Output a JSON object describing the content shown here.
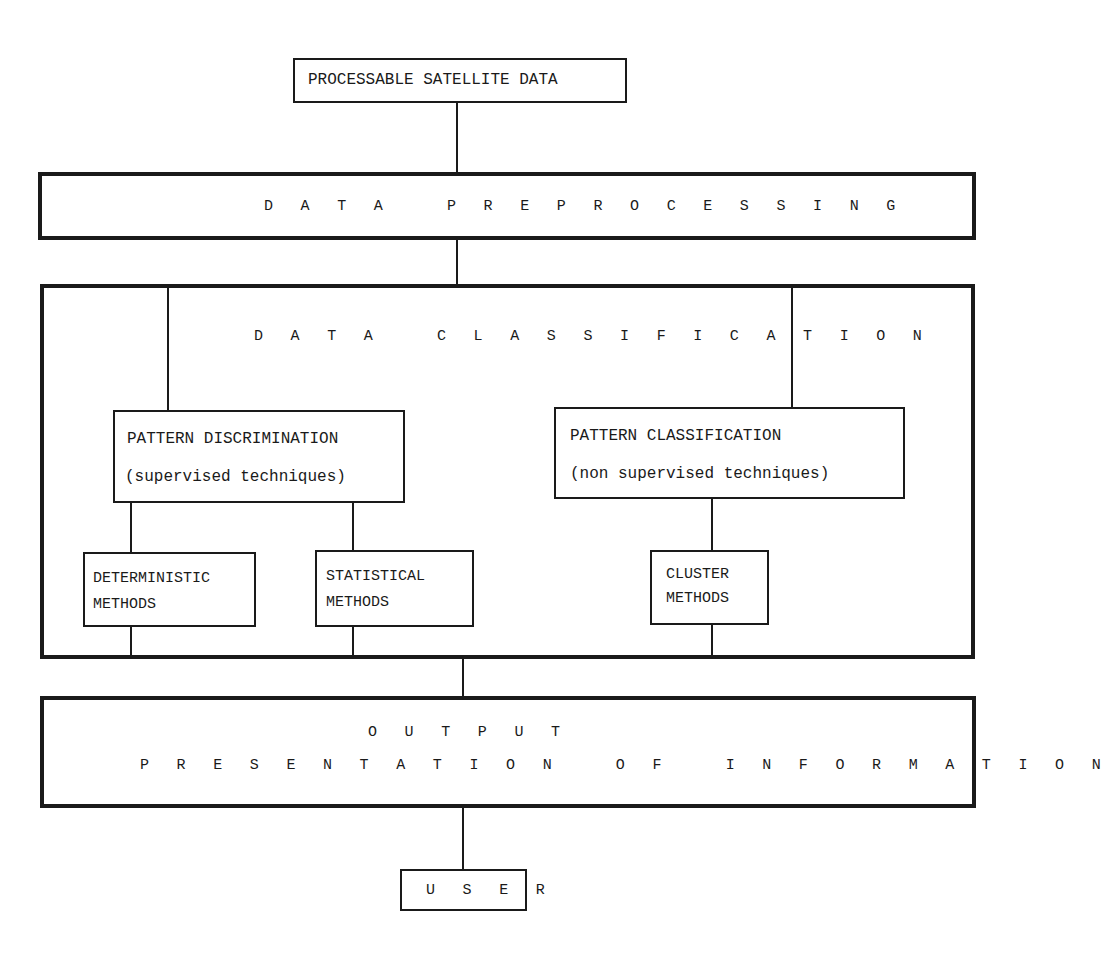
{
  "diagram": {
    "type": "flowchart",
    "nodes": {
      "source": {
        "label": "PROCESSABLE SATELLITE DATA"
      },
      "preprocessing": {
        "label": "D A T A   P R E P R O C E S S I N G"
      },
      "classification": {
        "label": "D A T A   C L A S S I F I C A T I O N"
      },
      "pattern_discrimination": {
        "title": "PATTERN DISCRIMINATION",
        "subtitle": "(supervised techniques)"
      },
      "pattern_classification": {
        "title": "PATTERN CLASSIFICATION",
        "subtitle": "(non supervised techniques)"
      },
      "deterministic": {
        "line1": "DETERMINISTIC",
        "line2": "METHODS"
      },
      "statistical": {
        "line1": "STATISTICAL",
        "line2": "METHODS"
      },
      "cluster": {
        "line1": "CLUSTER",
        "line2": "METHODS"
      },
      "output": {
        "line1": "O U T P U T",
        "line2": "P R E S E N T A T I O N   O F   I N F O R M A T I O N"
      },
      "user": {
        "label": "U S E R"
      }
    },
    "edges": [
      [
        "source",
        "preprocessing"
      ],
      [
        "preprocessing",
        "classification"
      ],
      [
        "classification",
        "pattern_discrimination"
      ],
      [
        "classification",
        "pattern_classification"
      ],
      [
        "pattern_discrimination",
        "deterministic"
      ],
      [
        "pattern_discrimination",
        "statistical"
      ],
      [
        "pattern_classification",
        "cluster"
      ],
      [
        "classification",
        "output"
      ],
      [
        "output",
        "user"
      ]
    ]
  }
}
